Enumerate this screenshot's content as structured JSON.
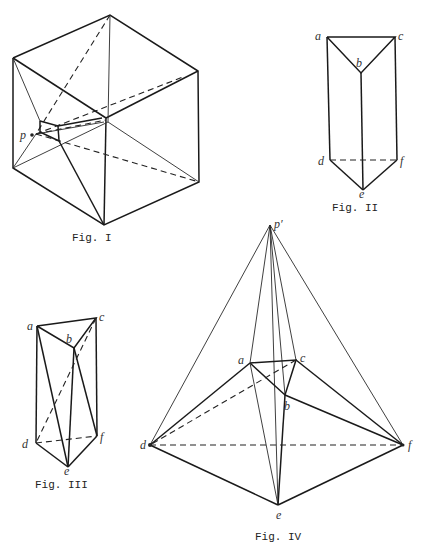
{
  "figures": [
    {
      "id": "fig1",
      "caption": "Fig. I",
      "labels": {
        "p": "p"
      }
    },
    {
      "id": "fig2",
      "caption": "Fig. II",
      "labels": {
        "a": "a",
        "b": "b",
        "c": "c",
        "d": "d",
        "e": "e",
        "f": "f"
      }
    },
    {
      "id": "fig3",
      "caption": "Fig. III",
      "labels": {
        "a": "a",
        "b": "b",
        "c": "c",
        "d": "d",
        "e": "e",
        "f": "f"
      }
    },
    {
      "id": "fig4",
      "caption": "Fig. IV",
      "labels": {
        "p": "p′",
        "a": "a",
        "b": "b",
        "c": "c",
        "d": "d",
        "e": "e",
        "f": "f"
      }
    }
  ]
}
